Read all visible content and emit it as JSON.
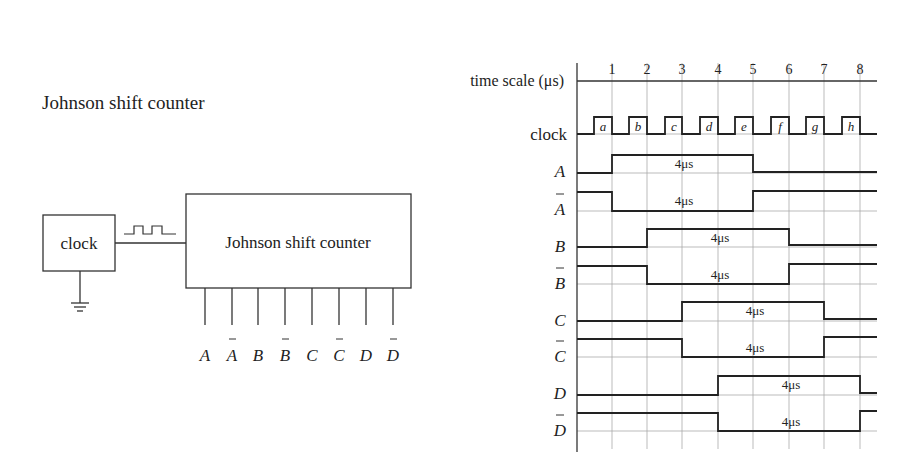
{
  "left_panel": {
    "title": "Johnson shift counter",
    "clock_box_label": "clock",
    "counter_box_label": "Johnson shift counter",
    "outputs": [
      "A",
      "Ā",
      "B",
      "B̄",
      "C",
      "C̄",
      "D",
      "D̄"
    ],
    "output_labels": [
      {
        "letter": "A",
        "bar": false
      },
      {
        "letter": "A",
        "bar": true
      },
      {
        "letter": "B",
        "bar": false
      },
      {
        "letter": "B",
        "bar": true
      },
      {
        "letter": "C",
        "bar": false
      },
      {
        "letter": "C",
        "bar": true
      },
      {
        "letter": "D",
        "bar": false
      },
      {
        "letter": "D",
        "bar": true
      }
    ]
  },
  "timing_diagram": {
    "time_scale_label": "time scale (μs)",
    "ticks": [
      "1",
      "2",
      "3",
      "4",
      "5",
      "6",
      "7",
      "8"
    ],
    "clock_label": "clock",
    "clock_pulse_labels": [
      "a",
      "b",
      "c",
      "d",
      "e",
      "f",
      "g",
      "h"
    ],
    "pulse_width_label": "4μs",
    "signals": [
      {
        "name": "A",
        "bar": false,
        "high_from": 1,
        "high_to": 5
      },
      {
        "name": "A",
        "bar": true,
        "high_from": null,
        "high_to": null,
        "low_from": 1,
        "low_to": 5
      },
      {
        "name": "B",
        "bar": false,
        "high_from": 2,
        "high_to": 6
      },
      {
        "name": "B",
        "bar": true,
        "low_from": 2,
        "low_to": 6
      },
      {
        "name": "C",
        "bar": false,
        "high_from": 3,
        "high_to": 7
      },
      {
        "name": "C",
        "bar": true,
        "low_from": 3,
        "low_to": 7
      },
      {
        "name": "D",
        "bar": false,
        "high_from": 4,
        "high_to": 8
      },
      {
        "name": "D",
        "bar": true,
        "low_from": 4,
        "low_to": 8
      }
    ]
  }
}
